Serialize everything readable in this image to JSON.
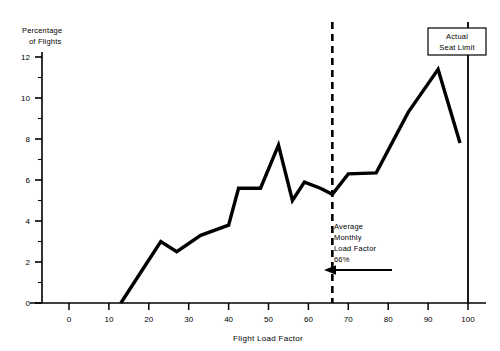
{
  "chart_data": {
    "type": "line",
    "title": "",
    "xlabel": "Flight Load Factor",
    "ylabel": "Percentage of Flights",
    "ylabel_line1": "Percentage",
    "ylabel_line2": "of Flights",
    "xlim": [
      0,
      100
    ],
    "ylim": [
      0,
      12
    ],
    "xticks": [
      0,
      10,
      20,
      30,
      40,
      50,
      60,
      70,
      80,
      90,
      100
    ],
    "xtick_labels": [
      "0",
      "10",
      "20",
      "30",
      "40",
      "50",
      "60",
      "70",
      "80",
      "90",
      "100"
    ],
    "yticks": [
      0,
      2,
      4,
      6,
      8,
      10,
      12
    ],
    "ytick_labels": [
      "0",
      "2",
      "4",
      "6",
      "8",
      "10",
      "12"
    ],
    "yminor_ticks": [
      1,
      3,
      5,
      7,
      9,
      11
    ],
    "grid": false,
    "legend": false,
    "series": [
      {
        "name": "Percentage of Flights",
        "color": "#000000",
        "x": [
          13,
          18,
          23,
          27,
          33,
          40,
          42.5,
          48,
          52.5,
          56,
          59,
          63,
          66,
          70,
          77,
          85,
          92.5,
          98
        ],
        "y": [
          0,
          1.5,
          3.0,
          2.5,
          3.3,
          3.8,
          5.6,
          5.6,
          7.7,
          5.0,
          5.9,
          5.6,
          5.3,
          6.3,
          6.35,
          9.3,
          11.4,
          7.8
        ]
      }
    ],
    "annotations": [
      {
        "name": "average-monthly-load-factor",
        "kind": "vertical-dashed-line",
        "x": 66,
        "color": "#000000",
        "text_lines": [
          "Average",
          "Monthly",
          "Load Factor",
          "66%"
        ],
        "arrow": "left"
      },
      {
        "name": "actual-seat-limit",
        "kind": "vertical-solid-line",
        "x": 100,
        "color": "#000000",
        "text_lines": [
          "Actual",
          "Seat Limit"
        ],
        "boxed": true
      }
    ]
  }
}
